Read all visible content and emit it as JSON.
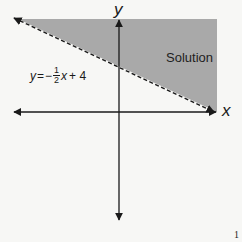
{
  "diagram": {
    "type": "linear-inequality-graph",
    "axes": {
      "x_label": "x",
      "y_label": "y"
    },
    "boundary_line": {
      "equation_parts": {
        "lhs": "y",
        "eq": "=",
        "sign": "−",
        "numerator": "1",
        "denominator": "2",
        "var": "x",
        "const": "+ 4"
      },
      "style": "dashed",
      "slope": -0.5,
      "y_intercept": 4
    },
    "region": {
      "label": "Solution",
      "shaded": "above line",
      "fill_color": "#a9a9a9"
    },
    "colors": {
      "axis": "#1a1a1a",
      "shade": "#a9a9a9",
      "background": "#f7f7f5"
    },
    "page_mark": "1"
  }
}
